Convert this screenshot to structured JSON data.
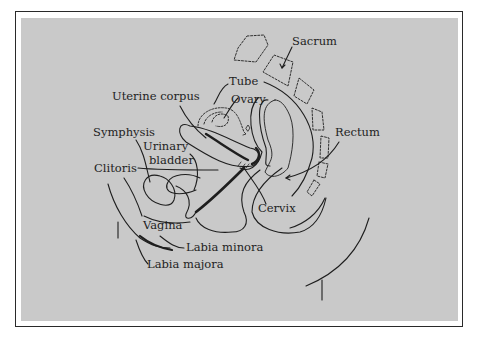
{
  "figure": {
    "type": "anatomical sagittal section diagram",
    "background_color": "#c9c9c9",
    "frame_color": "#2a2a2a",
    "line_color": "#1e1e1e"
  },
  "labels": {
    "sacrum": "Sacrum",
    "tube": "Tube",
    "uterine_corpus": "Uterine corpus",
    "ovary": "Ovary",
    "symphysis": "Symphysis",
    "urinary": "Urinary",
    "bladder": "bladder",
    "rectum": "Rectum",
    "clitoris": "Clitoris",
    "cervix": "Cervix",
    "vagina": "Vagina",
    "labia_minora": "Labia minora",
    "labia_majora": "Labia majora"
  }
}
